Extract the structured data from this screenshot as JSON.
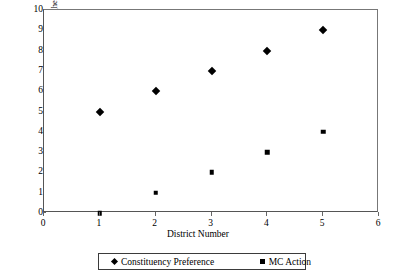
{
  "chart_data": {
    "type": "scatter",
    "title": "",
    "xlabel": "District Number",
    "ylabel": "Policy (Conservative values higher)",
    "xlim": [
      0,
      6
    ],
    "ylim": [
      0,
      10
    ],
    "xticks": [
      "0",
      "1",
      "2",
      "3",
      "4",
      "5",
      "6"
    ],
    "yticks": [
      "0",
      "1",
      "2",
      "3",
      "4",
      "5",
      "6",
      "7",
      "8",
      "9",
      "10"
    ],
    "grid": false,
    "legend_position": "bottom",
    "x": [
      1,
      2,
      3,
      4,
      5
    ],
    "series": [
      {
        "name": "Constituency Preference",
        "marker": "diamond",
        "color": "#000000",
        "values": [
          5,
          6,
          7,
          8,
          9
        ]
      },
      {
        "name": "MC Action",
        "marker": "square",
        "color": "#000000",
        "values": [
          0,
          1,
          2,
          3,
          4
        ]
      }
    ]
  },
  "legend": {
    "entries": [
      {
        "label": "Constituency Preference",
        "marker": "diamond-marker"
      },
      {
        "label": "MC Action",
        "marker": "square-marker"
      }
    ]
  }
}
